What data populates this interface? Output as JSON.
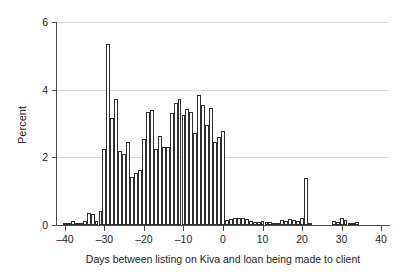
{
  "chart_data": {
    "type": "bar",
    "title": "",
    "subtitle": "",
    "xlabel": "Days between listing on Kiva and loan being made to client",
    "ylabel": "Percent",
    "xlim": [
      -42,
      42
    ],
    "ylim": [
      0,
      6
    ],
    "xticks": [
      -40,
      -30,
      -20,
      -10,
      0,
      10,
      20,
      30,
      40
    ],
    "yticks": [
      0,
      2,
      4,
      6
    ],
    "xtick_labels": [
      "–40",
      "–30",
      "–20",
      "–10",
      "0",
      "10",
      "20",
      "30",
      "40"
    ],
    "ytick_labels": [
      "0",
      "2",
      "4",
      "6"
    ],
    "grid": "horizontal",
    "legend": "none",
    "bin_width": 1,
    "bar_fill": "#ffffff",
    "bar_edge": "#2e2e2e",
    "gridline_color": "#d8d8d8",
    "axis_color": "#4a4a4a",
    "x": [
      -40,
      -39,
      -38,
      -37,
      -36,
      -35,
      -34,
      -33,
      -32,
      -31,
      -30,
      -29,
      -28,
      -27,
      -26,
      -25,
      -24,
      -23,
      -22,
      -21,
      -20,
      -19,
      -18,
      -17,
      -16,
      -15,
      -14,
      -13,
      -12,
      -11,
      -10,
      -9,
      -8,
      -7,
      -6,
      -5,
      -4,
      -3,
      -2,
      -1,
      0,
      1,
      2,
      3,
      4,
      5,
      6,
      7,
      8,
      9,
      10,
      11,
      12,
      13,
      14,
      15,
      16,
      17,
      18,
      19,
      20,
      21,
      22,
      23,
      24,
      25,
      26,
      27,
      28,
      29,
      30,
      31,
      32,
      33,
      34
    ],
    "values": [
      0.03,
      0.03,
      0.12,
      0.03,
      0.05,
      0.12,
      0.35,
      0.33,
      0.12,
      0.42,
      2.25,
      5.35,
      3.15,
      3.72,
      2.2,
      2.1,
      2.45,
      1.42,
      1.55,
      1.62,
      2.55,
      3.35,
      3.4,
      2.25,
      2.62,
      2.3,
      2.3,
      3.3,
      3.6,
      3.72,
      3.25,
      3.42,
      3.35,
      2.72,
      3.85,
      3.55,
      2.95,
      3.45,
      2.45,
      2.6,
      2.78,
      0.15,
      0.18,
      0.22,
      0.2,
      0.22,
      0.18,
      0.12,
      0.1,
      0.08,
      0.12,
      0.1,
      0.1,
      0.05,
      0.07,
      0.15,
      0.12,
      0.18,
      0.15,
      0.12,
      0.2,
      1.4,
      0.02,
      0.0,
      0.0,
      0.0,
      0.0,
      0.0,
      0.12,
      0.08,
      0.22,
      0.15,
      0.02,
      0.02,
      0.08
    ]
  }
}
